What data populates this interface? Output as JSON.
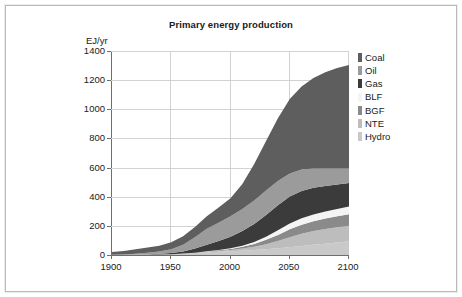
{
  "chart_data": {
    "type": "area",
    "title": "Primary energy production",
    "xlabel": "",
    "ylabel": "EJ/yr",
    "xlim": [
      1900,
      2100
    ],
    "ylim": [
      0,
      1400
    ],
    "ytick_labels": [
      "0",
      "200",
      "400",
      "600",
      "800",
      "1000",
      "1200",
      "1400"
    ],
    "ytick_values": [
      0,
      200,
      400,
      600,
      800,
      1000,
      1200,
      1400
    ],
    "xtick_labels": [
      "1900",
      "1950",
      "2000",
      "2050",
      "2100"
    ],
    "xtick_values": [
      1900,
      1950,
      2000,
      2050,
      2100
    ],
    "grid": true,
    "legend_position": "right",
    "stacking_note": "stacked from bottom: Hydro, NTE, BGF, BLF, Gas, Oil, Coal",
    "x": [
      1900,
      1910,
      1920,
      1930,
      1940,
      1950,
      1960,
      1970,
      1980,
      1990,
      2000,
      2010,
      2020,
      2030,
      2040,
      2050,
      2060,
      2070,
      2080,
      2090,
      2100
    ],
    "series": [
      {
        "name": "Hydro",
        "color": "#c9c9c9",
        "values": [
          1,
          1,
          2,
          3,
          4,
          6,
          9,
          13,
          18,
          22,
          26,
          30,
          34,
          40,
          46,
          54,
          62,
          70,
          78,
          86,
          94
        ]
      },
      {
        "name": "NTE",
        "color": "#bdbdbd",
        "values": [
          0,
          0,
          0,
          0,
          0,
          0,
          1,
          2,
          4,
          6,
          9,
          14,
          22,
          34,
          50,
          68,
          84,
          94,
          100,
          104,
          106
        ]
      },
      {
        "name": "BGF",
        "color": "#8a8a8a",
        "values": [
          0,
          0,
          0,
          0,
          0,
          0,
          0,
          1,
          2,
          4,
          7,
          12,
          20,
          30,
          42,
          54,
          62,
          68,
          72,
          76,
          80
        ]
      },
      {
        "name": "BLF",
        "color": "#f4f4f4",
        "values": [
          0,
          0,
          0,
          0,
          0,
          0,
          0,
          0,
          1,
          2,
          4,
          8,
          14,
          22,
          32,
          40,
          44,
          46,
          48,
          50,
          52
        ]
      },
      {
        "name": "Gas",
        "color": "#3b3b3b",
        "values": [
          0,
          0,
          1,
          2,
          4,
          7,
          14,
          28,
          45,
          62,
          80,
          100,
          122,
          148,
          172,
          186,
          188,
          184,
          176,
          168,
          162
        ]
      },
      {
        "name": "Oil",
        "color": "#9b9b9b",
        "values": [
          1,
          2,
          5,
          10,
          16,
          26,
          46,
          78,
          110,
          126,
          140,
          152,
          162,
          168,
          166,
          158,
          146,
          132,
          120,
          110,
          100
        ]
      },
      {
        "name": "Coal",
        "color": "#5e5e5e",
        "values": [
          18,
          24,
          32,
          36,
          40,
          48,
          58,
          70,
          86,
          104,
          124,
          172,
          250,
          340,
          430,
          510,
          570,
          620,
          660,
          690,
          710
        ]
      }
    ],
    "totals_note": "top of stack reaches about 1210 EJ/yr at 2100"
  },
  "legend": {
    "items": [
      {
        "label": "Coal",
        "color": "#5e5e5e"
      },
      {
        "label": "Oil",
        "color": "#9b9b9b"
      },
      {
        "label": "Gas",
        "color": "#3b3b3b"
      },
      {
        "label": "BLF",
        "color": "#f4f4f4"
      },
      {
        "label": "BGF",
        "color": "#8a8a8a"
      },
      {
        "label": "NTE",
        "color": "#bdbdbd"
      },
      {
        "label": "Hydro",
        "color": "#c9c9c9"
      }
    ]
  }
}
